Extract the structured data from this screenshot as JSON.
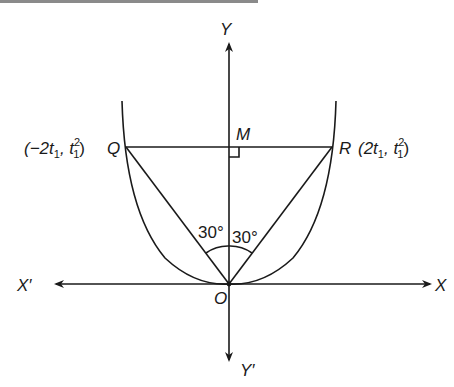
{
  "diagram": {
    "axes": {
      "x_positive": "X",
      "x_negative": "X′",
      "y_positive": "Y",
      "y_negative": "Y′"
    },
    "points": {
      "origin": "O",
      "Q": {
        "name": "Q",
        "coord_prefix": "(−2t",
        "coord_sub1": "1",
        "coord_mid": ", t",
        "coord_sup": "2",
        "coord_sub2": "1",
        "coord_suffix": ")"
      },
      "R": {
        "name": "R",
        "coord_prefix": "(2t",
        "coord_sub1": "1",
        "coord_mid": ", t",
        "coord_sup": "2",
        "coord_sub2": "1",
        "coord_suffix": ")"
      },
      "M": "M"
    },
    "angles": {
      "left": "30°",
      "right": "30°"
    },
    "colors": {
      "ink": "#1a1a1a",
      "background": "#ffffff"
    }
  }
}
